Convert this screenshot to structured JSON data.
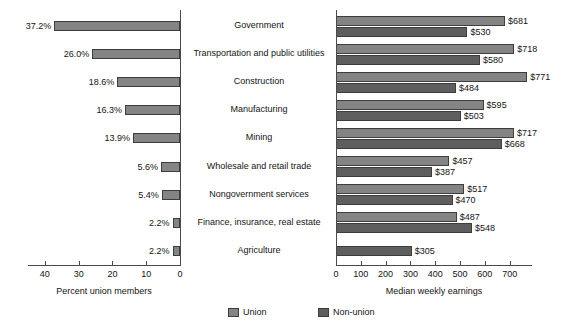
{
  "chart_data": {
    "type": "bar",
    "title": "",
    "subtitle": "",
    "orientation": "horizontal",
    "layout": "bilateral paired panels sharing centered category labels",
    "categories": [
      "Government",
      "Transportation and public utilities",
      "Construction",
      "Manufacturing",
      "Mining",
      "Wholesale and retail trade",
      "Nongovernment services",
      "Finance, insurance, real estate",
      "Agriculture"
    ],
    "panels": [
      {
        "id": "percent-union-members",
        "xlabel": "Percent union members",
        "ylabel": "",
        "xlim": [
          0,
          45
        ],
        "reversed": true,
        "grid": false,
        "ticks": [
          40,
          30,
          20,
          10,
          0
        ],
        "tick_labels": [
          "40",
          "30",
          "20",
          "10",
          "0"
        ],
        "series": [
          {
            "name": "Union",
            "values": [
              37.2,
              26.0,
              18.6,
              16.3,
              13.9,
              5.6,
              5.4,
              2.2,
              2.2
            ],
            "labels": [
              "37.2%",
              "26.0%",
              "18.6%",
              "16.3%",
              "13.9%",
              "5.6%",
              "5.4%",
              "2.2%",
              "2.2%"
            ]
          }
        ]
      },
      {
        "id": "median-weekly-earnings",
        "xlabel": "Median weekly earnings",
        "ylabel": "",
        "xlim": [
          0,
          790
        ],
        "reversed": false,
        "grid": false,
        "ticks": [
          0,
          100,
          200,
          300,
          400,
          500,
          600,
          700
        ],
        "tick_labels": [
          "0",
          "100",
          "200",
          "300",
          "400",
          "500",
          "600",
          "700"
        ],
        "series": [
          {
            "name": "Union",
            "values": [
              681,
              718,
              771,
              595,
              717,
              457,
              517,
              487,
              null
            ],
            "labels": [
              "$681",
              "$718",
              "$771",
              "$595",
              "$717",
              "$457",
              "$517",
              "$487",
              ""
            ]
          },
          {
            "name": "Non-union",
            "values": [
              530,
              580,
              484,
              503,
              668,
              387,
              470,
              548,
              305
            ],
            "labels": [
              "$530",
              "$580",
              "$484",
              "$503",
              "$668",
              "$387",
              "$470",
              "$548",
              "$305"
            ]
          }
        ]
      }
    ],
    "legend": {
      "position": "bottom-center",
      "entries": [
        {
          "label": "Union",
          "color": "#848484"
        },
        {
          "label": "Non-union",
          "color": "#5e5e5e"
        }
      ]
    },
    "colors": {
      "union": "#848484",
      "nonunion": "#5e5e5e",
      "axis": "#4a4a4a",
      "text": "#141414",
      "background": "#ffffff"
    }
  }
}
